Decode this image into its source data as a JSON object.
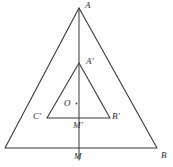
{
  "figure": {
    "kind": "geometry-diagram",
    "width": 173,
    "height": 167,
    "background_color": "#fdfdfd",
    "stroke_color": "#3a3a3a",
    "label_color": "#2c2c2c"
  },
  "labels": {
    "A": "A",
    "A_prime": "A'",
    "O": "O",
    "C_prime": "C'",
    "B_prime": "B'",
    "M_prime": "M'",
    "M": "M",
    "B": "B"
  },
  "geometry": {
    "outer_triangle": {
      "apex": {
        "x": 79,
        "y": 8
      },
      "base_left": {
        "x": 5,
        "y": 148
      },
      "base_right": {
        "x": 157,
        "y": 148
      }
    },
    "inner_triangle": {
      "apex": {
        "x": 79,
        "y": 63
      },
      "base_left": {
        "x": 47,
        "y": 118
      },
      "base_right": {
        "x": 110,
        "y": 118
      }
    },
    "axis_line": {
      "top": {
        "x": 79,
        "y": 8
      },
      "bottom": {
        "x": 79,
        "y": 160
      }
    },
    "center_point": {
      "x": 76,
      "y": 104
    }
  }
}
